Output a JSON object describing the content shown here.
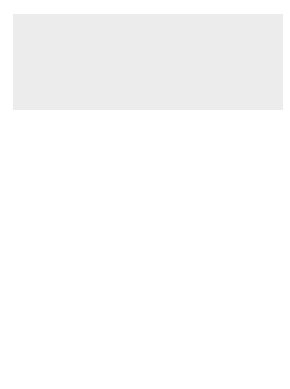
{
  "diagram": {
    "type": "hormonal-feedback-diagram",
    "colors": {
      "background_panel": "#ececec",
      "pathway_arrow": "#b8b8b8",
      "pathway_arrow_dark": "#9a9a9a",
      "tubule_circle": "#d9d9d9",
      "tubule_inner": "#bdbdbd",
      "cell_fill": "#f4f4f4",
      "nucleus": "#8c8c8c",
      "label_box": "#a9a9a9",
      "text": "#333333"
    },
    "labels": {
      "hypothalamus": "hypothalamus",
      "gnrh": "GnRH",
      "pituitary": "pituitary",
      "fsh": "FSH",
      "lh": "LH",
      "inhibin": "inhibin",
      "testosterone": "testosterone",
      "sperm_cell": "sperm cell",
      "sperm": "sperm",
      "testis": "testis",
      "leydig_cell": "Leydig cell",
      "tubule": "tubule",
      "sertoli_cell": "Sertoli cell"
    },
    "signs": {
      "inhibin_to_hypothalamus": "⊖",
      "inhibin_to_pituitary": "⊖",
      "gnrh_to_pituitary": "⊕",
      "testosterone_to_hypothalamus": "⊖",
      "testosterone_to_pituitary": "⊖",
      "fsh_to_tubule": "⊕",
      "lh_to_leydig": "⊕"
    }
  }
}
